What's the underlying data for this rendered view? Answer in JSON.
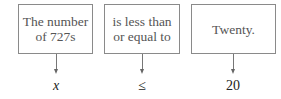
{
  "boxes": [
    {
      "text": "The number of 727s",
      "line1": "The number",
      "line2": "of 727s"
    },
    {
      "text": "is less than or equal to",
      "line1": "is less than",
      "line2": "or equal to"
    },
    {
      "text": "Twenty.",
      "line1": "Twenty.",
      "line2": ""
    }
  ],
  "symbols": [
    "x",
    "≤",
    "20"
  ]
}
